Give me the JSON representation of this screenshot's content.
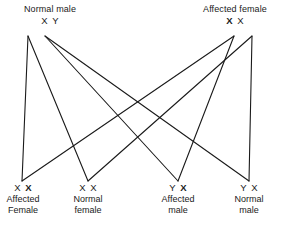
{
  "diagram": {
    "type": "genetic-cross",
    "background_color": "#ffffff",
    "line_color": "#1a1a1a",
    "parents": [
      {
        "id": "father",
        "title": "Normal male",
        "alleles": [
          {
            "symbol": "X",
            "bold": false
          },
          {
            "symbol": "Y",
            "bold": false
          }
        ]
      },
      {
        "id": "mother",
        "title": "Affected female",
        "alleles": [
          {
            "symbol": "X",
            "bold": true
          },
          {
            "symbol": "X",
            "bold": false
          }
        ]
      }
    ],
    "offspring": [
      {
        "id": "child-0",
        "alleles": [
          {
            "symbol": "X",
            "bold": false
          },
          {
            "symbol": "X",
            "bold": true
          }
        ],
        "line1": "Affected",
        "line2": "Female"
      },
      {
        "id": "child-1",
        "alleles": [
          {
            "symbol": "X",
            "bold": false
          },
          {
            "symbol": "X",
            "bold": false
          }
        ],
        "line1": "Normal",
        "line2": "female"
      },
      {
        "id": "child-2",
        "alleles": [
          {
            "symbol": "Y",
            "bold": false
          },
          {
            "symbol": "X",
            "bold": true
          }
        ],
        "line1": "Affected",
        "line2": "male"
      },
      {
        "id": "child-3",
        "alleles": [
          {
            "symbol": "Y",
            "bold": false
          },
          {
            "symbol": "X",
            "bold": false
          }
        ],
        "line1": "Normal",
        "line2": "male"
      }
    ]
  }
}
